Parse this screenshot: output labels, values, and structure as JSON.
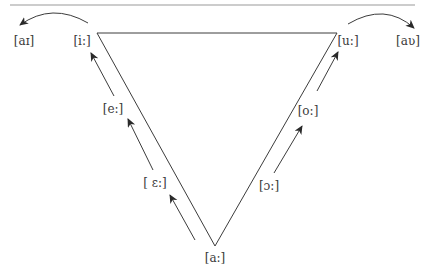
{
  "diagram": {
    "type": "vowel-shift-triangle",
    "colors": {
      "line": "#3c3c3c",
      "rule": "#9a9a9a",
      "text": "#3a3a3a"
    },
    "rule": {
      "x1": 10,
      "y1": 5,
      "x2": 415,
      "y2": 5
    },
    "triangle": {
      "top_left": [
        97,
        33
      ],
      "top_right": [
        337,
        33
      ],
      "bottom": [
        215,
        246
      ]
    },
    "labels": [
      {
        "id": "ai",
        "text": "[aɪ]",
        "x": 24,
        "y": 41
      },
      {
        "id": "i-long",
        "text": "[i:]",
        "x": 82,
        "y": 41
      },
      {
        "id": "u-long",
        "text": "[u:]",
        "x": 348,
        "y": 41
      },
      {
        "id": "au",
        "text": "[aʋ]",
        "x": 408,
        "y": 41
      },
      {
        "id": "e-long",
        "text": "[e:]",
        "x": 113,
        "y": 109
      },
      {
        "id": "open-e-long",
        "text": "[ ɛ:]",
        "x": 155,
        "y": 183
      },
      {
        "id": "o-long",
        "text": "[o:]",
        "x": 308,
        "y": 111
      },
      {
        "id": "open-o-long",
        "text": "[ɔ:]",
        "x": 269,
        "y": 186
      },
      {
        "id": "a-long",
        "text": "[a:]",
        "x": 215,
        "y": 258
      }
    ],
    "arrows": [
      {
        "id": "arrow-i-to-ai",
        "type": "curve",
        "from": [
          88,
          23
        ],
        "ctrl": [
          52,
          2
        ],
        "to": [
          20,
          25
        ]
      },
      {
        "id": "arrow-u-to-au",
        "type": "curve",
        "from": [
          348,
          24
        ],
        "ctrl": [
          385,
          2
        ],
        "to": [
          414,
          28
        ]
      },
      {
        "id": "arrow-e-to-i",
        "type": "straight",
        "from": [
          114,
          96
        ],
        "to": [
          91,
          53
        ]
      },
      {
        "id": "arrow-open-e-to-e",
        "type": "straight",
        "from": [
          153,
          170
        ],
        "to": [
          128,
          119
        ]
      },
      {
        "id": "arrow-a-to-open-e",
        "type": "straight",
        "from": [
          195,
          240
        ],
        "to": [
          170,
          195
        ]
      },
      {
        "id": "arrow-open-o-to-o",
        "type": "straight",
        "from": [
          274,
          173
        ],
        "to": [
          302,
          126
        ]
      },
      {
        "id": "arrow-o-to-u",
        "type": "straight",
        "from": [
          317,
          91
        ],
        "to": [
          338,
          52
        ]
      }
    ]
  }
}
